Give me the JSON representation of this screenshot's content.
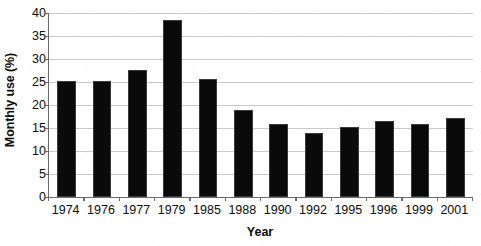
{
  "chart_data": {
    "type": "bar",
    "title": "",
    "subtitle": "",
    "xlabel": "Year",
    "ylabel": "Monthly use (%)",
    "categories": [
      "1974",
      "1976",
      "1977",
      "1979",
      "1985",
      "1988",
      "1990",
      "1992",
      "1995",
      "1996",
      "1999",
      "2001"
    ],
    "values": [
      25.3,
      25.3,
      27.7,
      38.5,
      25.6,
      19.0,
      15.8,
      14.0,
      15.3,
      16.5,
      15.8,
      17.2
    ],
    "series": [
      {
        "name": "Monthly use (%)",
        "values": [
          25.3,
          25.3,
          27.7,
          38.5,
          25.6,
          19.0,
          15.8,
          14.0,
          15.3,
          16.5,
          15.8,
          17.2
        ]
      }
    ],
    "ylim": [
      0,
      40
    ],
    "ytick_values": [
      0,
      5,
      10,
      15,
      20,
      25,
      30,
      35,
      40
    ],
    "ytick_labels": [
      "0",
      "5",
      "10",
      "15",
      "20",
      "25",
      "30",
      "35",
      "40"
    ],
    "grid": "horizontal",
    "legend": "none",
    "bar_color": "#0a0a0a",
    "gridline_color": "#c9c9c9",
    "axis_color": "#6a6a6a",
    "background_color": "#ffffff",
    "annotations": []
  },
  "axes": {
    "y_title": "Monthly use (%)",
    "x_title": "Year"
  }
}
